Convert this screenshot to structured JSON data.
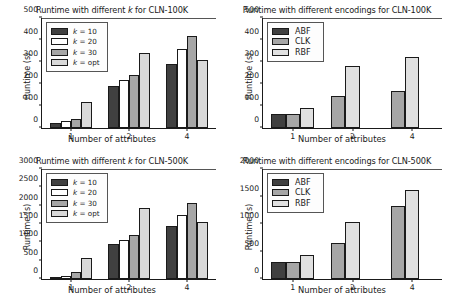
{
  "figure": {
    "axis_label_x": "Number of attributes",
    "axis_label_y": "Runtime (s)",
    "colors": {
      "k10": "#404040",
      "k20": "#ffffff",
      "k30": "#a6a6a6",
      "kopt": "#d9d9d9",
      "abf": "#404040",
      "clk": "#a6a6a6",
      "rbf": "#e0e0e0",
      "axis": "#1a1a1a",
      "background": "#ffffff"
    }
  },
  "chart_data": [
    {
      "id": "top-left",
      "type": "bar",
      "title": "Runtime with different k for CLN-100K",
      "title_prefix": "Runtime with different ",
      "title_italic": "k",
      "title_suffix": " for CLN-100K",
      "xlabel": "Number of attributes",
      "ylabel": "Runtime (s)",
      "categories": [
        "1",
        "2",
        "4"
      ],
      "ylim": [
        0,
        500
      ],
      "yticks": [
        0,
        100,
        200,
        300,
        400,
        500
      ],
      "grid": false,
      "legend_position": "upper left",
      "series": [
        {
          "name": "k = 10",
          "name_prefix": "k",
          "name_suffix": " = 10",
          "color": "#404040",
          "values": [
            22,
            192,
            292
          ]
        },
        {
          "name": "k = 20",
          "name_prefix": "k",
          "name_suffix": " = 20",
          "color": "#ffffff",
          "values": [
            32,
            217,
            358
          ]
        },
        {
          "name": "k = 30",
          "name_prefix": "k",
          "name_suffix": " = 30",
          "color": "#a6a6a6",
          "values": [
            42,
            240,
            417
          ]
        },
        {
          "name": "k = opt",
          "name_prefix": "k",
          "name_suffix": " = opt",
          "color": "#d9d9d9",
          "values": [
            119,
            339,
            308
          ]
        }
      ]
    },
    {
      "id": "top-right",
      "type": "bar",
      "title": "Runtime with different encodings for CLN-100K",
      "xlabel": "Number of attributes",
      "ylabel": "Runtime (s)",
      "categories": [
        "1",
        "2",
        "4"
      ],
      "ylim": [
        0,
        500
      ],
      "yticks": [
        0,
        100,
        200,
        300,
        400,
        500
      ],
      "grid": false,
      "legend_position": "upper left",
      "series": [
        {
          "name": "ABF",
          "color": "#404040",
          "values": [
            63,
            0,
            0
          ]
        },
        {
          "name": "CLK",
          "color": "#a6a6a6",
          "values": [
            64,
            145,
            168
          ]
        },
        {
          "name": "RBF",
          "color": "#e0e0e0",
          "values": [
            89,
            281,
            325
          ]
        }
      ]
    },
    {
      "id": "bottom-left",
      "type": "bar",
      "title": "Runtime with different k for CLN-500K",
      "title_prefix": "Runtime with different ",
      "title_italic": "k",
      "title_suffix": " for CLN-500K",
      "xlabel": "Number of attributes",
      "ylabel": "Runtime (s)",
      "categories": [
        "1",
        "2",
        "4"
      ],
      "ylim": [
        0,
        3000
      ],
      "yticks": [
        0,
        500,
        1000,
        1500,
        2000,
        2500,
        3000
      ],
      "grid": false,
      "legend_position": "upper left",
      "series": [
        {
          "name": "k = 10",
          "name_prefix": "k",
          "name_suffix": " = 10",
          "color": "#404040",
          "values": [
            55,
            955,
            1440
          ]
        },
        {
          "name": "k = 20",
          "name_prefix": "k",
          "name_suffix": " = 20",
          "color": "#ffffff",
          "values": [
            95,
            1055,
            1750
          ]
        },
        {
          "name": "k = 30",
          "name_prefix": "k",
          "name_suffix": " = 30",
          "color": "#a6a6a6",
          "values": [
            200,
            1190,
            2085
          ]
        },
        {
          "name": "k = opt",
          "name_prefix": "k",
          "name_suffix": " = opt",
          "color": "#d9d9d9",
          "values": [
            580,
            1930,
            1545
          ]
        }
      ]
    },
    {
      "id": "bottom-right",
      "type": "bar",
      "title": "Runtime with different encodings for CLN-500K",
      "xlabel": "Number of attributes",
      "ylabel": "Runtime (s)",
      "categories": [
        "1",
        "2",
        "4"
      ],
      "ylim": [
        0,
        2000
      ],
      "yticks": [
        0,
        500,
        1000,
        1500,
        2000
      ],
      "grid": false,
      "legend_position": "upper left",
      "series": [
        {
          "name": "ABF",
          "color": "#404040",
          "values": [
            315,
            0,
            0
          ]
        },
        {
          "name": "CLK",
          "color": "#a6a6a6",
          "values": [
            318,
            655,
            1330
          ]
        },
        {
          "name": "RBF",
          "color": "#e0e0e0",
          "values": [
            440,
            1035,
            1625
          ]
        }
      ]
    }
  ]
}
